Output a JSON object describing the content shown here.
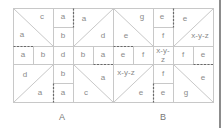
{
  "figure": {
    "grid": {
      "cols": 10,
      "rows": 5,
      "x0": 13,
      "y0": 8,
      "cell_w": 20,
      "cell_h": 18.8,
      "line_color": "#c8c8c8",
      "dash_color": "#6a6a6a"
    },
    "labels": {
      "A": "A",
      "B": "B"
    },
    "cells": [
      {
        "id": "A-tl-c",
        "text": "c",
        "x": 42,
        "y": 19
      },
      {
        "id": "A-tl-a",
        "text": "a",
        "x": 22,
        "y": 37
      },
      {
        "id": "A-c2r0",
        "text": "a",
        "x": 63,
        "y": 19
      },
      {
        "id": "A-c2r1",
        "text": "b",
        "x": 63,
        "y": 38
      },
      {
        "id": "A-tr-a",
        "text": "a",
        "x": 84,
        "y": 21
      },
      {
        "id": "A-tr-d",
        "text": "d",
        "x": 103,
        "y": 38
      },
      {
        "id": "A-r2c0",
        "text": "a",
        "x": 23,
        "y": 57
      },
      {
        "id": "A-r2c1",
        "text": "b",
        "x": 43,
        "y": 57
      },
      {
        "id": "A-r2c2",
        "text": "d",
        "x": 63,
        "y": 57
      },
      {
        "id": "A-r2c3",
        "text": "b",
        "x": 83,
        "y": 57
      },
      {
        "id": "A-r2c4",
        "text": "a",
        "x": 103,
        "y": 57
      },
      {
        "id": "A-bl-d",
        "text": "d",
        "x": 25,
        "y": 77
      },
      {
        "id": "A-bl-a",
        "text": "a",
        "x": 40,
        "y": 95
      },
      {
        "id": "A-c2r3",
        "text": "b",
        "x": 63,
        "y": 76
      },
      {
        "id": "A-c2r4",
        "text": "a",
        "x": 63,
        "y": 95
      },
      {
        "id": "A-br-a",
        "text": "a",
        "x": 103,
        "y": 80
      },
      {
        "id": "A-br-c",
        "text": "c",
        "x": 86,
        "y": 95
      },
      {
        "id": "B-tl-g",
        "text": "g",
        "x": 142,
        "y": 19
      },
      {
        "id": "B-tl-e",
        "text": "e",
        "x": 126,
        "y": 38
      },
      {
        "id": "B-c7r0",
        "text": "e",
        "x": 162,
        "y": 19
      },
      {
        "id": "B-c7r1",
        "text": "f",
        "x": 163,
        "y": 38
      },
      {
        "id": "B-tr-e",
        "text": "e",
        "x": 185,
        "y": 21
      },
      {
        "id": "B-tr-xyz",
        "text": "x-y-z",
        "x": 200,
        "y": 38
      },
      {
        "id": "B-r2c5",
        "text": "e",
        "x": 123,
        "y": 57
      },
      {
        "id": "B-r2c6",
        "text": "f",
        "x": 143,
        "y": 57
      },
      {
        "id": "B-r2c7a",
        "text": "x-y-",
        "x": 163,
        "y": 53
      },
      {
        "id": "B-r2c7b",
        "text": "z",
        "x": 163,
        "y": 62
      },
      {
        "id": "B-r2c8",
        "text": "f",
        "x": 183,
        "y": 57
      },
      {
        "id": "B-r2c9",
        "text": "e",
        "x": 203,
        "y": 57
      },
      {
        "id": "B-bl-xyz",
        "text": "x-y-z",
        "x": 126,
        "y": 75
      },
      {
        "id": "B-bl-e",
        "text": "e",
        "x": 141,
        "y": 95
      },
      {
        "id": "B-c7r3",
        "text": "f",
        "x": 163,
        "y": 76
      },
      {
        "id": "B-c7r4",
        "text": "e",
        "x": 163,
        "y": 95
      },
      {
        "id": "B-br-e",
        "text": "e",
        "x": 203,
        "y": 80
      },
      {
        "id": "B-br-g",
        "text": "g",
        "x": 186,
        "y": 95
      }
    ]
  }
}
